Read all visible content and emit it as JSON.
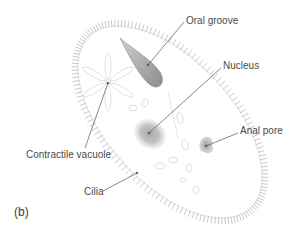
{
  "figure": {
    "panel_label": "(b)",
    "labels": {
      "oral_groove": "Oral groove",
      "nucleus": "Nucleus",
      "anal_pore": "Anal pore",
      "contractile_vacuole": "Contractile vacuole",
      "cilia": "Cilia"
    },
    "colors": {
      "background": "#ffffff",
      "cilia": "#c8c8c8",
      "leader_line": "#555555",
      "label_text": "#4a4a4a",
      "oral_groove": "#9a9a9a",
      "nucleus": "#b0b0b0",
      "organelle_outline": "#d8d8d8"
    }
  }
}
